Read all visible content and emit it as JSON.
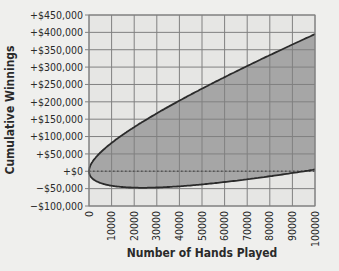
{
  "chart_data": {
    "type": "area",
    "title": "",
    "xlabel": "Number of Hands Played",
    "ylabel": "Cumulative Winnings",
    "xlim": [
      0,
      100000
    ],
    "ylim": [
      -100000,
      450000
    ],
    "grid": true,
    "legend": null,
    "x_ticks": [
      "0",
      "10000",
      "20000",
      "30000",
      "40000",
      "50000",
      "60000",
      "70000",
      "80000",
      "90000",
      "100000"
    ],
    "y_ticks": [
      "+$450,000",
      "+$400,000",
      "+$350,000",
      "+$300,000",
      "+$250,000",
      "+$200,000",
      "+$150,000",
      "+$100,000",
      "+$50,000",
      "+$0",
      "−$50,000",
      "−$100,000"
    ],
    "y_tick_values": [
      450000,
      400000,
      350000,
      300000,
      250000,
      200000,
      150000,
      100000,
      50000,
      0,
      -50000,
      -100000
    ],
    "x": [
      0,
      2500,
      5000,
      10000,
      15000,
      20000,
      25000,
      30000,
      40000,
      50000,
      60000,
      70000,
      80000,
      90000,
      100000
    ],
    "series": [
      {
        "name": "Upper bound",
        "values": [
          0,
          35800,
          53600,
          81700,
          105500,
          127200,
          147500,
          166800,
          203000,
          237900,
          271000,
          303000,
          334400,
          365000,
          395000
        ]
      },
      {
        "name": "Lower bound",
        "values": [
          0,
          -25800,
          -33600,
          -41700,
          -45500,
          -47200,
          -47500,
          -46800,
          -43000,
          -37900,
          -31000,
          -23000,
          -14400,
          -5000,
          5000
        ]
      },
      {
        "name": "Break-even (dotted)",
        "values": [
          0,
          0,
          0,
          0,
          0,
          0,
          0,
          0,
          0,
          0,
          0,
          0,
          0,
          0,
          0
        ]
      }
    ],
    "colors": {
      "band_fill": "#a6a6a6",
      "plot_bg": "#e6e6e4",
      "grid": "#808080",
      "curve": "#2b2b2b",
      "zero_line": "#555555"
    }
  }
}
